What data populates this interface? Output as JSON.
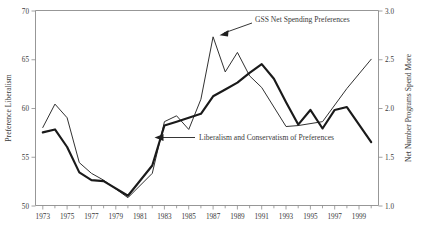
{
  "chart_data": {
    "type": "line",
    "title": "",
    "xlabel": "",
    "ylabel": "Preference Liberalism",
    "y2label": "Net Number Programs Spend More",
    "xlim": [
      1972.4,
      2000.6
    ],
    "ylim": [
      50,
      70
    ],
    "y2lim": [
      1.0,
      3.0
    ],
    "grid": false,
    "legend": "none (inline annotations with arrows)",
    "xticks": [
      1973,
      1975,
      1977,
      1979,
      1981,
      1983,
      1985,
      1987,
      1989,
      1991,
      1993,
      1995,
      1997,
      1999
    ],
    "xtick_labels": [
      "1973",
      "1975",
      "1977",
      "1979",
      "1981",
      "1983",
      "1985",
      "1987",
      "1989",
      "1991",
      "1993",
      "1995",
      "1997",
      "1999"
    ],
    "xminor_ticks": [
      1974,
      1976,
      1978,
      1980,
      1982,
      1984,
      1986,
      1988,
      1990,
      1992,
      1994,
      1996,
      1998,
      2000
    ],
    "yticks": [
      50,
      55,
      60,
      65,
      70
    ],
    "ytick_labels": [
      "50",
      "55",
      "60",
      "65",
      "70"
    ],
    "y2ticks": [
      1.0,
      1.5,
      2.0,
      2.5,
      3.0
    ],
    "y2tick_labels": [
      "1.0",
      "1.5",
      "2.0",
      "2.5",
      "3.0"
    ],
    "series": [
      {
        "name": "GSS Net Spending Preferences",
        "axis": "right",
        "style": "thin",
        "x": [
          1973,
          1974,
          1975,
          1976,
          1977,
          1978,
          1980,
          1982,
          1983,
          1984,
          1985,
          1986,
          1987,
          1988,
          1989,
          1990,
          1991,
          1993,
          1994,
          1996,
          1998,
          2000
        ],
        "values_left_scale": [
          58.0,
          60.4,
          59.0,
          54.4,
          53.3,
          52.6,
          50.8,
          53.3,
          58.6,
          59.2,
          57.8,
          60.9,
          67.3,
          63.7,
          65.7,
          63.3,
          62.1,
          58.1,
          58.2,
          58.6,
          62.0,
          65.0
        ],
        "values": [
          1.8,
          2.04,
          1.9,
          1.44,
          1.33,
          1.26,
          1.08,
          1.33,
          1.86,
          1.92,
          1.78,
          2.09,
          2.73,
          2.37,
          2.57,
          2.33,
          2.21,
          1.81,
          1.82,
          1.86,
          2.2,
          2.5
        ]
      },
      {
        "name": "Liberalism and Conservatism of Preferences",
        "axis": "left",
        "style": "thick",
        "x": [
          1973,
          1974,
          1975,
          1976,
          1977,
          1978,
          1980,
          1982,
          1983,
          1984,
          1985,
          1986,
          1987,
          1988,
          1989,
          1990,
          1991,
          1992,
          1993,
          1994,
          1995,
          1996,
          1997,
          1998,
          1999,
          2000
        ],
        "values_left_scale": [
          57.5,
          57.8,
          56.0,
          53.4,
          52.6,
          52.5,
          51.0,
          54.1,
          58.2,
          58.6,
          59.0,
          59.4,
          61.2,
          61.9,
          62.6,
          63.6,
          64.5,
          63.0,
          60.6,
          58.3,
          59.8,
          57.9,
          59.8,
          60.1,
          58.3,
          56.5
        ],
        "values": [
          57.5,
          57.8,
          56.0,
          53.4,
          52.6,
          52.5,
          51.0,
          54.1,
          58.2,
          58.6,
          59.0,
          59.4,
          61.2,
          61.9,
          62.6,
          63.6,
          64.5,
          63.0,
          60.6,
          58.3,
          59.8,
          57.9,
          59.8,
          60.1,
          58.3,
          56.5
        ]
      }
    ],
    "annotations": [
      {
        "text": "GSS Net Spending Preferences",
        "points_to_series": "GSS Net Spending Preferences",
        "points_to_x": 1987
      },
      {
        "text": "Liberalism and Conservatism of Preferences",
        "points_to_series": "Liberalism and Conservatism of Preferences",
        "points_to_x": 1982
      }
    ]
  }
}
